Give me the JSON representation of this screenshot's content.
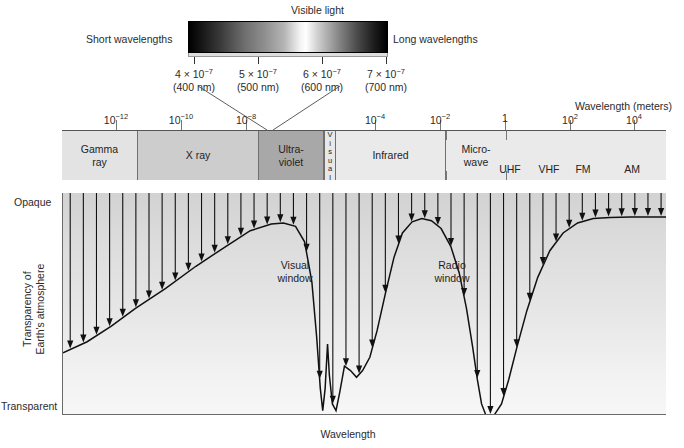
{
  "visible": {
    "title": "Visible light",
    "short_label": "Short wavelengths",
    "long_label": "Long wavelengths",
    "ticks": [
      {
        "mantissa": "4 × 10",
        "exp": "−7",
        "nm": "(400 nm)",
        "x": 194
      },
      {
        "mantissa": "5 × 10",
        "exp": "−7",
        "nm": "(500 nm)",
        "x": 258
      },
      {
        "mantissa": "6 × 10",
        "exp": "−7",
        "nm": "(600 nm)",
        "x": 322
      },
      {
        "mantissa": "7 × 10",
        "exp": "−7",
        "nm": "(700 nm)",
        "x": 386
      }
    ]
  },
  "axis": {
    "caption": "Wavelength (meters)",
    "ticks": [
      {
        "mantissa": "10",
        "exp": "−12",
        "x": 116
      },
      {
        "mantissa": "10",
        "exp": "−10",
        "x": 181
      },
      {
        "mantissa": "10",
        "exp": "−8",
        "x": 246
      },
      {
        "mantissa": "10",
        "exp": "−4",
        "x": 375
      },
      {
        "mantissa": "10",
        "exp": "−2",
        "x": 440
      },
      {
        "mantissa": "1",
        "exp": "",
        "x": 505
      },
      {
        "mantissa": "10",
        "exp": "2",
        "x": 570
      },
      {
        "mantissa": "10",
        "exp": "4",
        "x": 634
      }
    ]
  },
  "bands": [
    {
      "name": "Gamma ray",
      "line1": "Gamma",
      "line2": "ray",
      "left": 0,
      "width": 76,
      "fill": "#e3e3e3",
      "vertical": false
    },
    {
      "name": "X ray",
      "line1": "X ray",
      "line2": "",
      "left": 76,
      "width": 121,
      "fill": "#cdcdcd",
      "vertical": false
    },
    {
      "name": "Ultraviolet",
      "line1": "Ultra-",
      "line2": "violet",
      "left": 197,
      "width": 65,
      "fill": "#a8a8a8",
      "vertical": false
    },
    {
      "name": "Visual",
      "line1": "Visual",
      "line2": "",
      "left": 262,
      "width": 12,
      "fill": "#e8e8e8",
      "vertical": true
    },
    {
      "name": "Infrared",
      "line1": "Infrared",
      "line2": "",
      "left": 274,
      "width": 110,
      "fill": "#eaeaea",
      "vertical": false
    },
    {
      "name": "Microwave",
      "line1": "Micro-",
      "line2": "wave",
      "left": 384,
      "width": 60,
      "fill": "#eaeaea",
      "vertical": false
    },
    {
      "name": "Radio",
      "line1": "",
      "line2": "",
      "left": 444,
      "width": 160,
      "fill": "#eaeaea",
      "vertical": false
    }
  ],
  "radio_subbands": [
    {
      "label": "UHF",
      "x": 448
    },
    {
      "label": "VHF",
      "x": 487
    },
    {
      "label": "FM",
      "x": 521
    },
    {
      "label": "AM",
      "x": 570
    }
  ],
  "plot": {
    "y_top_label": "Opaque",
    "y_bottom_label": "Transparent",
    "y_axis_title_line1": "Transparency of",
    "y_axis_title_line2": "Earth's atmosphere",
    "x_axis_title": "Wavelength",
    "annotations": [
      {
        "name": "visual-window",
        "line1": "Visual",
        "line2": "window",
        "x": 295,
        "y": 259
      },
      {
        "name": "radio-window",
        "line1": "Radio",
        "line2": "window",
        "x": 452,
        "y": 259
      }
    ]
  },
  "chart_data": {
    "type": "line",
    "xlabel": "Wavelength",
    "ylabel": "Transparency of Earth's atmosphere",
    "ytick_labels": [
      "Transparent",
      "Opaque"
    ],
    "ylim": [
      0,
      1
    ],
    "note": "y = 1 is Opaque (top), y = 0 is Transparent (bottom). Curve is the opacity envelope; vertical arrows are incoming radiation stopped at the curve.",
    "series": [
      {
        "name": "Atmospheric opacity envelope",
        "points": [
          [
            0.0,
            0.28
          ],
          [
            0.04,
            0.33
          ],
          [
            0.08,
            0.4
          ],
          [
            0.12,
            0.48
          ],
          [
            0.17,
            0.57
          ],
          [
            0.22,
            0.67
          ],
          [
            0.27,
            0.76
          ],
          [
            0.31,
            0.83
          ],
          [
            0.345,
            0.86
          ],
          [
            0.365,
            0.865
          ],
          [
            0.385,
            0.85
          ],
          [
            0.4,
            0.78
          ],
          [
            0.412,
            0.6
          ],
          [
            0.42,
            0.35
          ],
          [
            0.426,
            0.12
          ],
          [
            0.43,
            0.02
          ],
          [
            0.434,
            0.12
          ],
          [
            0.438,
            0.32
          ],
          [
            0.441,
            0.18
          ],
          [
            0.446,
            0.05
          ],
          [
            0.452,
            0.02
          ],
          [
            0.458,
            0.1
          ],
          [
            0.466,
            0.22
          ],
          [
            0.476,
            0.2
          ],
          [
            0.486,
            0.17
          ],
          [
            0.496,
            0.2
          ],
          [
            0.508,
            0.26
          ],
          [
            0.52,
            0.38
          ],
          [
            0.534,
            0.55
          ],
          [
            0.548,
            0.71
          ],
          [
            0.562,
            0.82
          ],
          [
            0.578,
            0.87
          ],
          [
            0.594,
            0.885
          ],
          [
            0.61,
            0.875
          ],
          [
            0.626,
            0.84
          ],
          [
            0.642,
            0.76
          ],
          [
            0.656,
            0.64
          ],
          [
            0.668,
            0.48
          ],
          [
            0.678,
            0.31
          ],
          [
            0.686,
            0.16
          ],
          [
            0.693,
            0.05
          ],
          [
            0.7,
            0.0
          ],
          [
            0.714,
            0.0
          ],
          [
            0.726,
            0.05
          ],
          [
            0.738,
            0.16
          ],
          [
            0.752,
            0.31
          ],
          [
            0.768,
            0.47
          ],
          [
            0.786,
            0.62
          ],
          [
            0.806,
            0.74
          ],
          [
            0.828,
            0.82
          ],
          [
            0.852,
            0.865
          ],
          [
            0.878,
            0.885
          ],
          [
            0.906,
            0.89
          ],
          [
            0.94,
            0.892
          ],
          [
            1.0,
            0.892
          ]
        ]
      }
    ],
    "windows": [
      {
        "name": "Visual window",
        "x_center": 0.452,
        "description": "Narrow transparent notch at visible wavelengths"
      },
      {
        "name": "Radio window",
        "x_center": 0.707,
        "description": "Broad transparent region at radio wavelengths"
      }
    ],
    "spectrum_bands": [
      "Gamma ray",
      "X ray",
      "Ultraviolet",
      "Visual",
      "Infrared",
      "Microwave",
      "Radio"
    ],
    "wavelength_axis_ticks_m": [
      "1e-12",
      "1e-10",
      "1e-8",
      "1e-4",
      "1e-2",
      "1",
      "1e2",
      "1e4"
    ],
    "visible_axis_ticks_m": [
      "4e-7",
      "5e-7",
      "6e-7",
      "7e-7"
    ]
  }
}
